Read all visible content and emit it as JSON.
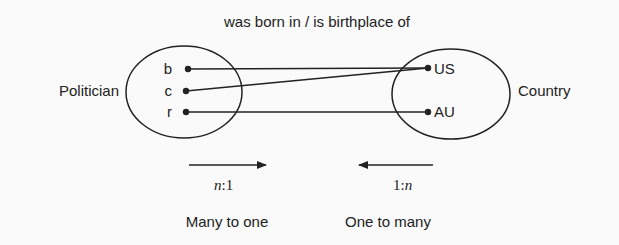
{
  "title": "was born in / is birthplace of",
  "left_set": {
    "label": "Politician",
    "elements": [
      "b",
      "c",
      "r"
    ]
  },
  "right_set": {
    "label": "Country",
    "elements": [
      "US",
      "AU"
    ]
  },
  "mappings": [
    {
      "from": "b",
      "to": "US"
    },
    {
      "from": "c",
      "to": "US"
    },
    {
      "from": "r",
      "to": "AU"
    }
  ],
  "cardinality": {
    "forward": {
      "ratio_n": "n",
      "ratio_sep": ":",
      "ratio_1": "1",
      "description": "Many to one",
      "direction": "right"
    },
    "backward": {
      "ratio_1": "1",
      "ratio_sep": ":",
      "ratio_n": "n",
      "description": "One to many",
      "direction": "left"
    }
  }
}
